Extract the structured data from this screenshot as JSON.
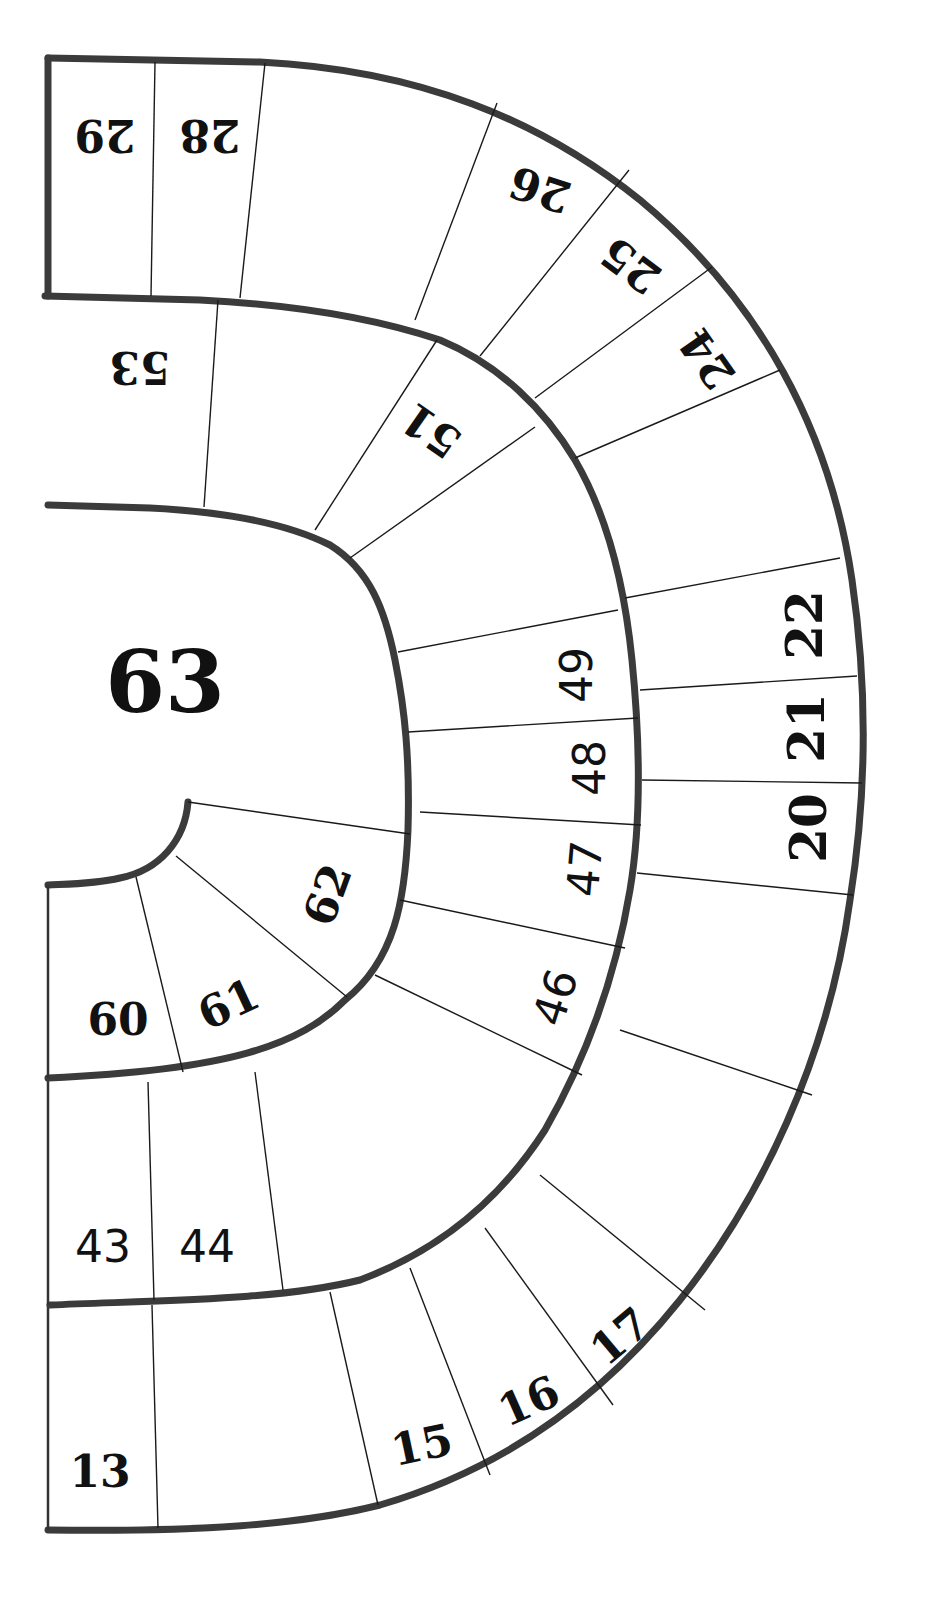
{
  "board": {
    "type": "spiral-race-game-board",
    "colors": {
      "background": "#ffffff",
      "border": "#3b3b3b",
      "divider": "#1a1a1a",
      "numerals": "#111111"
    },
    "squares": {
      "s13": "13",
      "s15": "15",
      "s16": "16",
      "s17": "17",
      "s20": "20",
      "s21": "21",
      "s22": "22",
      "s24": "24",
      "s25": "25",
      "s26": "26",
      "s28": "28",
      "s29": "29",
      "s43": "43",
      "s44": "44",
      "s46": "46",
      "s47": "47",
      "s48": "48",
      "s49": "49",
      "s51": "51",
      "s53": "53",
      "s60": "60",
      "s61": "61",
      "s62": "62",
      "s63": "63"
    },
    "goal_square": "63"
  }
}
